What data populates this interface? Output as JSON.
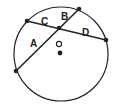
{
  "diagram": {
    "type": "circle-intersecting-chords",
    "chords": [
      {
        "name": "chord-1",
        "segments": [
          "A",
          "B"
        ]
      },
      {
        "name": "chord-2",
        "segments": [
          "C",
          "D"
        ]
      }
    ],
    "labels": {
      "A": "A",
      "B": "B",
      "C": "C",
      "D": "D",
      "O": "O"
    },
    "points": {
      "center_marker": "open-circle",
      "other_marker": "filled-dot"
    },
    "colors": {
      "stroke": "#222222",
      "background": "#ffffff"
    }
  }
}
